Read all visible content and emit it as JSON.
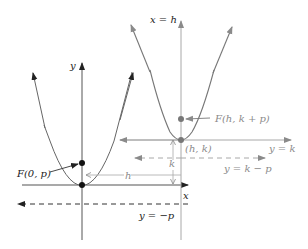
{
  "diagram": {
    "colors": {
      "dark": "#222222",
      "gray": "#8a8a8a",
      "light_gray": "#a8a8a8"
    },
    "left_parabola": {
      "y_axis_label": "y",
      "x_axis_label": "x",
      "focus_label": "F(0, p)",
      "directrix_label": "y = −p"
    },
    "right_parabola": {
      "axis_label": "x = h",
      "focus_label": "F(h, k + p)",
      "vertex_label": "(h, k)",
      "line_k_label": "y = k",
      "directrix_label": "y = k − p"
    },
    "shift_labels": {
      "horizontal": "h",
      "vertical": "k"
    }
  }
}
